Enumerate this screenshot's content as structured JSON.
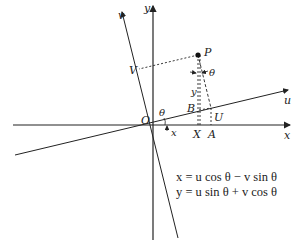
{
  "diagram": {
    "labels": {
      "y_axis": "y",
      "x_axis": "x",
      "u_axis": "u",
      "v_axis": "v",
      "origin": "O",
      "point": "P",
      "V": "V",
      "B": "B",
      "U": "U",
      "X": "X",
      "A": "A",
      "theta_origin": "θ",
      "theta_at_P": "θ",
      "x_near_origin": "x",
      "y_segment": "y"
    },
    "equations": [
      "x = u cos θ − v sin θ",
      "y = u sin θ + v cos θ"
    ]
  }
}
